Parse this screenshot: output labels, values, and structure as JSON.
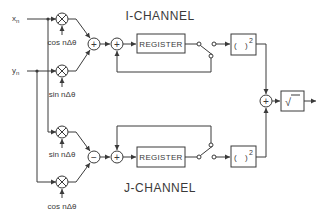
{
  "diagram": {
    "i_channel_title": "I-CHANNEL",
    "j_channel_title": "J-CHANNEL",
    "inputs": {
      "x": "x",
      "x_sub": "n",
      "y": "y",
      "y_sub": "n"
    },
    "multipliers": [
      {
        "id": "m1",
        "ref": "cos nΔθ",
        "inputs": [
          "x_n"
        ]
      },
      {
        "id": "m2",
        "ref": "sin nΔθ",
        "inputs": [
          "y_n"
        ]
      },
      {
        "id": "m3",
        "ref": "sin nΔθ",
        "inputs": [
          "x_n"
        ]
      },
      {
        "id": "m4",
        "ref": "cos nΔθ",
        "inputs": [
          "y_n"
        ]
      }
    ],
    "combiners": {
      "i_sum": "+",
      "j_diff": "−"
    },
    "accumulators": {
      "i_adder": "+",
      "j_adder": "+",
      "final_adder": "+"
    },
    "blocks": {
      "i_register": "REGISTER",
      "j_register": "REGISTER",
      "i_square_open": "(",
      "i_square_close": ")",
      "i_square_exp": "2",
      "j_square_open": "(",
      "j_square_close": ")",
      "j_square_exp": "2",
      "sqrt": "√"
    },
    "colors": {
      "line": "#3a3a3a",
      "background": "#ffffff"
    }
  }
}
